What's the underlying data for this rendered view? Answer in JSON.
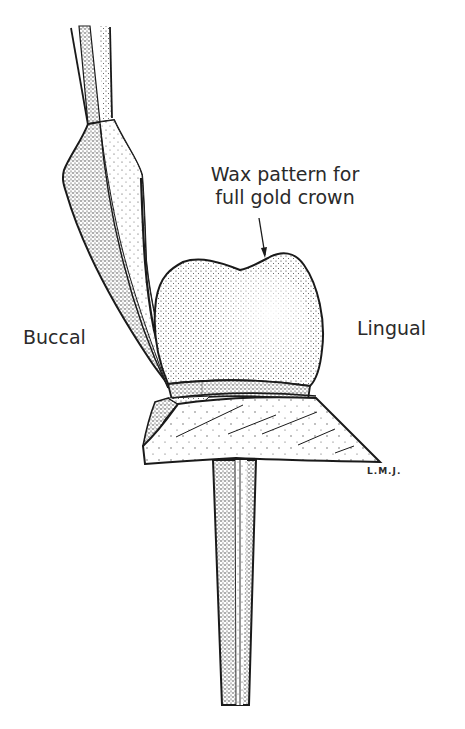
{
  "figure": {
    "type": "technical illustration",
    "annotation": {
      "line1": "Wax pattern for",
      "line2": "full gold crown",
      "pointer": "arrow pointing to occlusal surface of wax pattern"
    },
    "labels": {
      "left": "Buccal",
      "right": "Lingual"
    },
    "signature": "L.M.J.",
    "colors": {
      "ink": "#1a1a1a",
      "background": "#ffffff",
      "text": "#2a2a2a"
    },
    "parts": [
      "instrument (carver) from top-left",
      "wax pattern crown",
      "margin band",
      "die base (trapezoid)",
      "tapered die pin"
    ]
  }
}
